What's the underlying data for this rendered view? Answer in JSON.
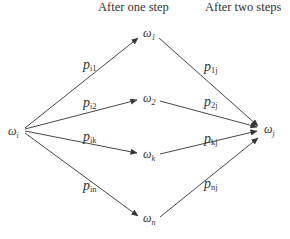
{
  "headers": {
    "step_one": "After one step",
    "step_two": "After two steps"
  },
  "nodes": {
    "start": {
      "symbol": "ω",
      "sub": "i"
    },
    "mid": [
      {
        "symbol": "ω",
        "sub": "1"
      },
      {
        "symbol": "ω",
        "sub": "2"
      },
      {
        "symbol": "ω",
        "sub": "k"
      },
      {
        "symbol": "ω",
        "sub": "n"
      }
    ],
    "end": {
      "symbol": "ω",
      "sub": "j"
    }
  },
  "edges": {
    "first_step": [
      {
        "symbol": "p",
        "sub": "i1"
      },
      {
        "symbol": "p",
        "sub": "i2"
      },
      {
        "symbol": "p",
        "sub": "ik"
      },
      {
        "symbol": "p",
        "sub": "in"
      }
    ],
    "second_step": [
      {
        "symbol": "p",
        "sub": "1j"
      },
      {
        "symbol": "p",
        "sub": "2j"
      },
      {
        "symbol": "p",
        "sub": "kj"
      },
      {
        "symbol": "p",
        "sub": "nj"
      }
    ]
  },
  "colors": {
    "line": "#333333",
    "text": "#333333",
    "background": "#ffffff"
  }
}
